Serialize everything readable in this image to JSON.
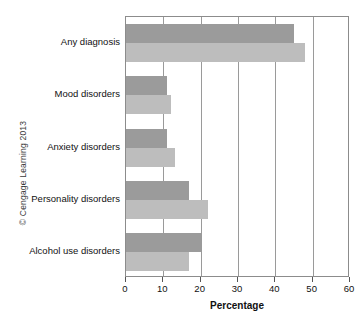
{
  "credit": {
    "text": "© Cengage Learning 2013"
  },
  "bottom_caption": {
    "text": ""
  },
  "chart_data": {
    "type": "bar",
    "orientation": "horizontal",
    "title": "",
    "xlabel": "Percentage",
    "ylabel": "",
    "xlim": [
      0,
      60
    ],
    "xticks": [
      0,
      10,
      20,
      30,
      40,
      50,
      60
    ],
    "xticklabels": [
      "0",
      "10",
      "20",
      "30",
      "40",
      "50",
      "60"
    ],
    "grid": "vertical",
    "legend": "none",
    "categories": [
      "Any diagnosis",
      "Mood disorders",
      "Anxiety disorders",
      "Personality disorders",
      "Alcohol use disorders"
    ],
    "series": [
      {
        "name": "series-1",
        "color": "#9b9b9b",
        "values": [
          45,
          11,
          11,
          17,
          20
        ]
      },
      {
        "name": "series-2",
        "color": "#bdbdbd",
        "values": [
          48,
          12,
          13,
          22,
          17
        ]
      }
    ]
  }
}
